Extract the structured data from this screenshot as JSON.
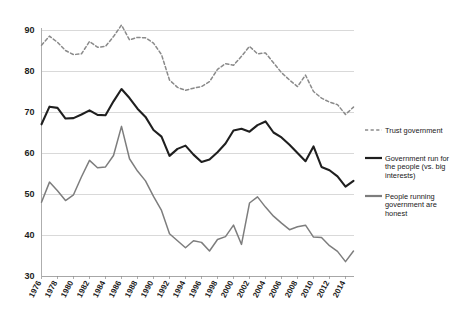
{
  "chart_data": {
    "type": "line",
    "title": "",
    "subtitle": "",
    "xlabel": "",
    "ylabel": "",
    "ylim": [
      30,
      92
    ],
    "yticks": [
      30,
      40,
      50,
      60,
      70,
      80,
      90
    ],
    "ytick_labels": [
      "30",
      "40",
      "50",
      "60",
      "70",
      "80",
      "90"
    ],
    "grid": true,
    "legend_position": "right",
    "x": [
      1976,
      1977,
      1978,
      1979,
      1980,
      1981,
      1982,
      1983,
      1984,
      1985,
      1986,
      1987,
      1988,
      1989,
      1990,
      1991,
      1992,
      1993,
      1994,
      1995,
      1996,
      1997,
      1998,
      1999,
      2000,
      2001,
      2002,
      2003,
      2004,
      2005,
      2006,
      2007,
      2008,
      2009,
      2010,
      2011,
      2012,
      2013,
      2014,
      2015
    ],
    "xtick_labels": [
      "1976",
      "1978",
      "1980",
      "1982",
      "1984",
      "1986",
      "1988",
      "1990",
      "1992",
      "1994",
      "1996",
      "1998",
      "2000",
      "2002",
      "2004",
      "2006",
      "2008",
      "2010",
      "2012",
      "2014"
    ],
    "xticks": [
      1976,
      1978,
      1980,
      1982,
      1984,
      1986,
      1988,
      1990,
      1992,
      1994,
      1996,
      1998,
      2000,
      2002,
      2004,
      2006,
      2008,
      2010,
      2012,
      2014
    ],
    "series": [
      {
        "name": "Trust government",
        "style": "dashed",
        "color": "#8a8a8a",
        "width": 1.5,
        "values": [
          86.3,
          88.5,
          87.0,
          85.0,
          84.0,
          84.2,
          87.2,
          85.8,
          86.0,
          88.4,
          91.2,
          87.6,
          88.2,
          88.1,
          86.8,
          84.0,
          77.8,
          76.0,
          75.3,
          75.8,
          76.2,
          77.4,
          80.4,
          81.8,
          81.4,
          83.6,
          86.0,
          84.2,
          84.4,
          82.0,
          79.6,
          77.8,
          76.2,
          79.0,
          75.0,
          73.4,
          72.4,
          71.8,
          69.4,
          71.2
        ]
      },
      {
        "name": "Government run for the people (vs. big interests)",
        "style": "solid",
        "color": "#1f1f1f",
        "width": 2.1,
        "values": [
          67.0,
          71.3,
          71.0,
          68.4,
          68.5,
          69.4,
          70.4,
          69.3,
          69.2,
          72.6,
          75.6,
          73.4,
          70.8,
          68.8,
          65.6,
          64.0,
          59.3,
          61.0,
          61.8,
          59.6,
          57.8,
          58.4,
          60.2,
          62.3,
          65.5,
          65.9,
          65.2,
          66.8,
          67.7,
          65.0,
          63.8,
          62.0,
          60.0,
          58.0,
          61.6,
          56.6,
          55.8,
          54.3,
          51.8,
          53.2
        ]
      },
      {
        "name": "People running government are honest",
        "style": "solid",
        "color": "#7d7d7d",
        "width": 1.5,
        "values": [
          48.0,
          52.9,
          50.8,
          48.4,
          49.8,
          54.2,
          58.2,
          56.4,
          56.6,
          59.4,
          66.5,
          58.6,
          55.6,
          53.2,
          49.4,
          46.0,
          40.3,
          38.6,
          36.9,
          38.6,
          38.2,
          36.1,
          38.9,
          39.6,
          42.4,
          37.7,
          47.8,
          49.3,
          46.8,
          44.6,
          42.9,
          41.3,
          42.0,
          42.4,
          39.5,
          39.4,
          37.4,
          36.0,
          33.5,
          36.1
        ]
      }
    ],
    "legend": [
      {
        "label": "Trust government",
        "style": "dashed",
        "color": "#8a8a8a"
      },
      {
        "label": "Government run for the people (vs. big interests)",
        "style": "solid",
        "color": "#1f1f1f"
      },
      {
        "label": "People running government are honest",
        "style": "solid",
        "color": "#7d7d7d"
      }
    ]
  },
  "colors": {
    "background": "#ffffff",
    "gridline": "#c9c9c9",
    "axis": "#9a9a9a",
    "text": "#1a1a1a"
  }
}
